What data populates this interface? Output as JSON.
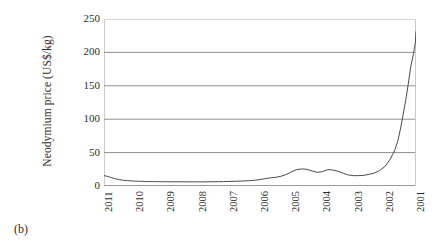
{
  "caption": "(b)",
  "chart_data": {
    "type": "line",
    "title": "",
    "subtitle": "",
    "xlabel": "",
    "ylabel": "Neodymium price (US$/kg)",
    "ylim": [
      0,
      250
    ],
    "yticks": [
      250,
      200,
      150,
      100,
      50,
      0
    ],
    "ytick_labels": [
      "250",
      "200",
      "150",
      "100",
      "50",
      "0"
    ],
    "grid": "horizontal",
    "legend": "none",
    "x_axis_reversed": true,
    "x_axis_note": "Years run right-to-left: 2011 at left edge, 2001 at right edge",
    "categories": [
      "2011",
      "2010",
      "2009",
      "2008",
      "2007",
      "2006",
      "2005",
      "2004",
      "2003",
      "2002",
      "2001"
    ],
    "xtick_labels": [
      "2011",
      "2010",
      "2009",
      "2008",
      "2007",
      "2006",
      "2005",
      "2004",
      "2003",
      "2002",
      "2001"
    ],
    "series": [
      {
        "name": "Neodymium price (US$/kg)",
        "color": "#4a4a4a",
        "x": [
          2011.0,
          2010.92,
          2010.83,
          2010.75,
          2010.67,
          2010.58,
          2010.5,
          2010.42,
          2010.33,
          2010.25,
          2010.17,
          2010.08,
          2010.0,
          2009.92,
          2009.83,
          2009.75,
          2009.67,
          2009.58,
          2009.5,
          2009.42,
          2009.33,
          2009.25,
          2009.17,
          2009.08,
          2009.0,
          2008.83,
          2008.67,
          2008.5,
          2008.33,
          2008.17,
          2008.0,
          2007.83,
          2007.67,
          2007.5,
          2007.33,
          2007.17,
          2007.0,
          2006.83,
          2006.67,
          2006.5,
          2006.33,
          2006.17,
          2006.0,
          2005.83,
          2005.67,
          2005.5,
          2005.33,
          2005.17,
          2005.0,
          2004.83,
          2004.67,
          2004.5,
          2004.33,
          2004.17,
          2004.0,
          2003.83,
          2003.67,
          2003.5,
          2003.33,
          2003.17,
          2003.0,
          2002.83,
          2002.67,
          2002.5,
          2002.33,
          2002.17,
          2002.0,
          2001.92,
          2001.83,
          2001.75,
          2001.67,
          2001.58,
          2001.5,
          2001.42,
          2001.33,
          2001.25,
          2001.17,
          2001.08,
          2001.02,
          2001.0
        ],
        "values": [
          15.5,
          14.8,
          13.6,
          12.4,
          11.2,
          10.2,
          9.4,
          8.8,
          8.3,
          8.0,
          7.7,
          7.5,
          7.3,
          7.1,
          7.0,
          6.9,
          6.8,
          6.7,
          6.6,
          6.6,
          6.5,
          6.5,
          6.4,
          6.4,
          6.4,
          6.3,
          6.3,
          6.3,
          6.2,
          6.2,
          6.2,
          6.2,
          6.3,
          6.4,
          6.5,
          6.6,
          6.8,
          7.0,
          7.3,
          7.6,
          8.0,
          8.6,
          9.6,
          11.0,
          12.2,
          13.0,
          14.5,
          17.0,
          21.0,
          24.5,
          25.5,
          25.0,
          22.5,
          20.5,
          21.5,
          24.5,
          24.0,
          22.0,
          19.0,
          16.5,
          15.5,
          15.5,
          16.0,
          17.5,
          19.5,
          23.0,
          29.0,
          34.0,
          40.0,
          47.0,
          55.0,
          68.0,
          85.0,
          105.0,
          128.0,
          152.0,
          178.0,
          198.0,
          215.0,
          231.0
        ]
      }
    ]
  }
}
